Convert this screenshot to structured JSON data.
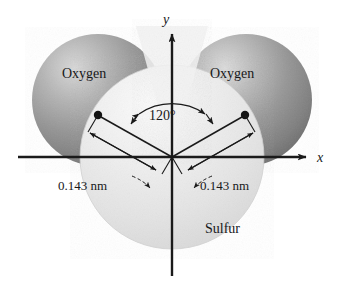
{
  "figure": {
    "background_color": "#ffffff"
  },
  "atoms": [
    {
      "id": "oxygen-left",
      "label": "Oxygen",
      "cx": 98,
      "cy": 100,
      "r": 66,
      "fill": "#8e8e8e",
      "highlight": "#d2d2d2",
      "label_x": 62,
      "label_y": 78
    },
    {
      "id": "oxygen-right",
      "label": "Oxygen",
      "cx": 246,
      "cy": 100,
      "r": 66,
      "fill": "#8e8e8e",
      "highlight": "#d2d2d2",
      "label_x": 210,
      "label_y": 78
    },
    {
      "id": "sulfur-center",
      "label": "Sulfur",
      "cx": 172,
      "cy": 157,
      "r": 92,
      "fill": "#e4e4e4",
      "highlight": "#f4f4f4",
      "label_x": 205,
      "label_y": 233
    }
  ],
  "axes": {
    "origin_x": 172,
    "origin_y": 157,
    "x_label": "x",
    "x_label_x": 322,
    "x_label_y": 162,
    "x_start_x": 18,
    "x_end_x": 312,
    "y_label": "y",
    "y_label_x": 166,
    "y_label_y": 22,
    "y_top_y": 28,
    "y_bottom_y": 276,
    "color": "#1a1a1a"
  },
  "bonds": [
    {
      "id": "bond-left",
      "dot_x": 98,
      "dot_y": 115,
      "length_label": "0.143 nm",
      "label_x": 62,
      "label_y": 186,
      "arrow_tip_x": 147,
      "arrow_tip_y": 180
    },
    {
      "id": "bond-right",
      "dot_x": 245,
      "dot_y": 115,
      "length_label": "0.143 nm",
      "label_x": 203,
      "label_y": 186,
      "arrow_tip_x": 194,
      "arrow_tip_y": 180
    }
  ],
  "angle": {
    "label": "120°",
    "value_degrees": 120,
    "label_x": 149,
    "label_y": 118,
    "arc_radius": 56
  },
  "colors": {
    "oxygen_gray": "#8e8e8e",
    "sulfur_gray": "#e4e4e4",
    "line_black": "#1a1a1a",
    "text_black": "#17181a"
  }
}
